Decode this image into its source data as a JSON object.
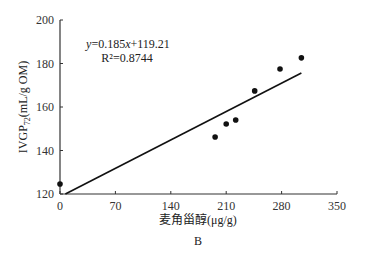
{
  "chart_data": {
    "type": "scatter",
    "panel_label": "B",
    "xlabel": "麦角甾醇(μg/g)",
    "ylabel": "IVGP72 (mL/g OM)",
    "ylabel_main": "IVGP",
    "ylabel_sub": "72",
    "ylabel_unit": "(mL/g OM)",
    "xlim": [
      0,
      350
    ],
    "ylim": [
      120,
      200
    ],
    "xticks": [
      0,
      70,
      140,
      210,
      280,
      350
    ],
    "yticks": [
      120,
      140,
      160,
      180,
      200
    ],
    "points": [
      {
        "x": 0,
        "y": 124.6
      },
      {
        "x": 196,
        "y": 146.2
      },
      {
        "x": 210,
        "y": 152.2
      },
      {
        "x": 222,
        "y": 154.0
      },
      {
        "x": 246,
        "y": 167.4
      },
      {
        "x": 278,
        "y": 177.5
      },
      {
        "x": 305,
        "y": 182.6
      }
    ],
    "trendline": {
      "slope": 0.185,
      "intercept": 119.21,
      "x_range": [
        0,
        305
      ]
    },
    "equation_text": "y=0.185x+119.21",
    "equation_y": "y",
    "equation_rest1": "=0.185",
    "equation_x": "x",
    "equation_rest2": "+119.21",
    "r2_text": "R²=0.8744",
    "grid": false
  }
}
